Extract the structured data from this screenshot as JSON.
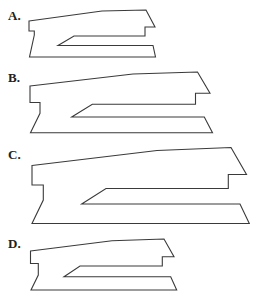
{
  "figure": {
    "type": "multiple-choice-shape-options",
    "stroke_color": "#3a3a3a",
    "label_color": "#222222",
    "background": "#ffffff",
    "options": [
      {
        "id": "A",
        "label": "A.",
        "label_pos": [
          8,
          20
        ],
        "outline": [
          [
            29,
            21
          ],
          [
            102,
            11
          ],
          [
            146,
            10
          ],
          [
            155,
            27
          ],
          [
            145,
            27
          ],
          [
            145,
            36
          ],
          [
            74,
            36
          ],
          [
            58,
            45.5
          ],
          [
            153,
            45.5
          ],
          [
            155.5,
            57
          ],
          [
            29.5,
            57
          ],
          [
            34.3,
            35
          ],
          [
            34.3,
            31
          ],
          [
            29,
            31
          ]
        ]
      },
      {
        "id": "B",
        "label": "B.",
        "label_pos": [
          8,
          82
        ],
        "outline": [
          [
            30,
            86
          ],
          [
            133,
            74
          ],
          [
            197.5,
            72
          ],
          [
            210,
            93.3
          ],
          [
            195.5,
            93.3
          ],
          [
            195.5,
            104.3
          ],
          [
            92.3,
            104.3
          ],
          [
            71.7,
            117
          ],
          [
            204.3,
            117
          ],
          [
            212.5,
            132.8
          ],
          [
            30.5,
            132.8
          ],
          [
            40,
            113.3
          ],
          [
            40,
            102.5
          ],
          [
            30,
            102.5
          ]
        ]
      },
      {
        "id": "C",
        "label": "C.",
        "label_pos": [
          8,
          159
        ],
        "outline": [
          [
            32,
            165.5
          ],
          [
            157,
            150.5
          ],
          [
            231,
            147.5
          ],
          [
            246.5,
            174.5
          ],
          [
            228.3,
            174.5
          ],
          [
            228.3,
            188.5
          ],
          [
            106,
            188.5
          ],
          [
            81.7,
            204
          ],
          [
            240,
            204
          ],
          [
            249.3,
            223.5
          ],
          [
            32,
            223.5
          ],
          [
            43.3,
            200
          ],
          [
            43.3,
            185
          ],
          [
            32,
            185
          ]
        ]
      },
      {
        "id": "D",
        "label": "D.",
        "label_pos": [
          8,
          248
        ],
        "outline": [
          [
            30.5,
            251
          ],
          [
            112,
            240.7
          ],
          [
            164,
            239
          ],
          [
            174,
            256.7
          ],
          [
            162.3,
            256.7
          ],
          [
            162.3,
            266
          ],
          [
            80,
            266
          ],
          [
            64,
            276.7
          ],
          [
            170.7,
            276.7
          ],
          [
            176.7,
            290
          ],
          [
            31,
            290
          ],
          [
            38.3,
            275
          ],
          [
            38.3,
            263.5
          ],
          [
            30.5,
            263.5
          ]
        ]
      }
    ]
  }
}
